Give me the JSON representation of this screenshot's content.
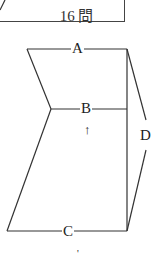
{
  "header": {
    "label": "16 問"
  },
  "diagram": {
    "labels": {
      "a": "A",
      "b": "B",
      "c": "C",
      "d": "D"
    },
    "arrow": "↑",
    "bottom_mark": "'"
  },
  "colors": {
    "line": "#333333",
    "background": "#ffffff"
  }
}
